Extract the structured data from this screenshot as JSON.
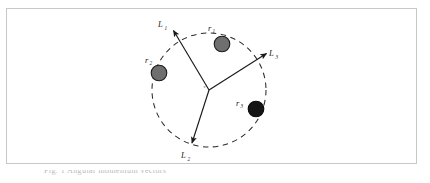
{
  "figure": {
    "kind": "vector-diagram",
    "border_color": "#c8c8c8",
    "background": "#ffffff",
    "center_vertex_label": "v",
    "circle": {
      "cx": 209,
      "cy": 90,
      "r": 57,
      "style": "dashed",
      "color": "#2b2b2b"
    },
    "vectors": [
      {
        "name": "L1",
        "label": "L",
        "subscript": "1",
        "from": [
          209,
          90
        ],
        "to": [
          172,
          28
        ],
        "label_pos": [
          160,
          25
        ],
        "color": "#1a1a1a"
      },
      {
        "name": "L3",
        "label": "L",
        "subscript": "3",
        "from": [
          209,
          90
        ],
        "to": [
          268,
          52
        ],
        "label_pos": [
          271,
          55
        ],
        "color": "#1a1a1a"
      },
      {
        "name": "L2",
        "label": "L",
        "subscript": "2",
        "from": [
          209,
          90
        ],
        "to": [
          191,
          145
        ],
        "label_pos": [
          183,
          158
        ],
        "color": "#1a1a1a"
      }
    ],
    "particles": [
      {
        "name": "r1",
        "label": "r",
        "subscript": "1",
        "pos": [
          222,
          44
        ],
        "radius": 8,
        "fill": "#6f6f6f",
        "stroke": "#1a1a1a",
        "label_pos": [
          209,
          30
        ]
      },
      {
        "name": "r2",
        "label": "r",
        "subscript": "2",
        "pos": [
          159,
          73
        ],
        "radius": 8,
        "fill": "#6f6f6f",
        "stroke": "#1a1a1a",
        "label_pos": [
          146,
          62
        ]
      },
      {
        "name": "r3",
        "label": "r",
        "subscript": "3",
        "pos": [
          256,
          109
        ],
        "radius": 8,
        "fill": "#151515",
        "stroke": "#0a0a0a",
        "label_pos": [
          238,
          104
        ]
      }
    ]
  },
  "caption": {
    "text": "Fig. 1  Angular momentum vectors"
  }
}
